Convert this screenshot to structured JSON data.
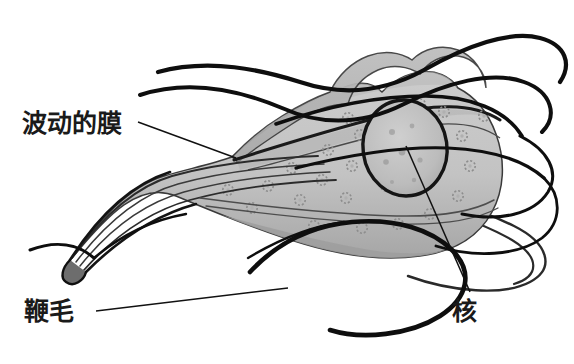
{
  "figure": {
    "background_color": "#ffffff",
    "line_color": "#111111",
    "body_fill": "#c2c2c2",
    "body_fill_dark": "#9a9a9a",
    "membrane_fill": "#b5b5b5",
    "nucleus_fill": "#bdbdbd",
    "nucleus_outline": "#1c1c1c"
  },
  "labels": {
    "undulating_membrane": "波动的膜",
    "flagella": "鞭毛",
    "nucleus": "核"
  },
  "parts": {
    "undulating_membrane_name": "undulating-membrane",
    "flagella_name": "flagella",
    "nucleus_name": "nucleus",
    "cell_body_name": "cell-body",
    "axostyle_name": "axostyle"
  }
}
